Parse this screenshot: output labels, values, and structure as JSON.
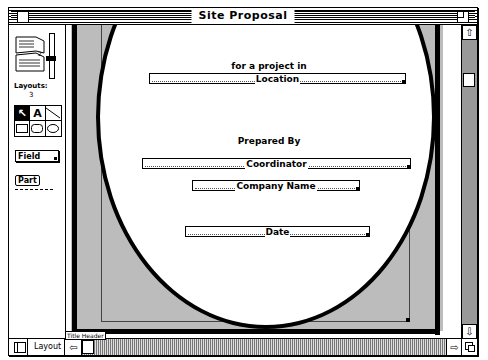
{
  "window": {
    "title": "Site Proposal"
  },
  "palette": {
    "layout_label": "Layouts:",
    "layout_count": "3",
    "tools": [
      {
        "name": "pointer",
        "glyph": "↖"
      },
      {
        "name": "text",
        "glyph": "A"
      },
      {
        "name": "line",
        "glyph": "╲"
      },
      {
        "name": "rectangle",
        "glyph": ""
      },
      {
        "name": "rounded-rectangle",
        "glyph": ""
      },
      {
        "name": "oval",
        "glyph": ""
      }
    ],
    "field_tool_label": "Field",
    "part_tool_label": "Part"
  },
  "layout": {
    "heading_project": "for a project in",
    "field_location": "Location",
    "heading_prepared": "Prepared By",
    "field_coordinator": "Coordinator",
    "field_company": "Company Name",
    "field_date": "Date",
    "part_label": "Title Header"
  },
  "statusbar": {
    "mode": "Layout"
  }
}
